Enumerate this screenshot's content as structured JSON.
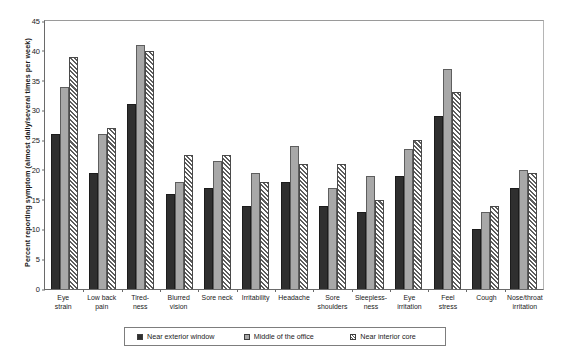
{
  "chart_data": {
    "type": "bar",
    "title": "",
    "xlabel": "",
    "ylabel": "Percent reporting symptom (almost daily/several times per week)",
    "ylim": [
      0,
      45
    ],
    "yticks": [
      0,
      5,
      10,
      15,
      20,
      25,
      30,
      35,
      40,
      45
    ],
    "grid": false,
    "legend_position": "bottom",
    "categories": [
      "Eye\nstrain",
      "Low back\npain",
      "Tired-\nness",
      "Blurred\nvision",
      "Sore neck",
      "Irritability",
      "Headache",
      "Sore\nshoulders",
      "Sleepless-\nness",
      "Eye\nirritation",
      "Feel\nstress",
      "Cough",
      "Nose/throat\nirritation"
    ],
    "series": [
      {
        "name": "Near exterior window",
        "color": "#2f2f2f",
        "pattern": "solid-dark",
        "values": [
          26,
          19.5,
          31,
          16,
          17,
          14,
          18,
          14,
          13,
          19,
          29,
          10,
          17
        ]
      },
      {
        "name": "Middle of the office",
        "color": "#a8a8a8",
        "pattern": "solid-gray",
        "values": [
          34,
          26,
          41,
          18,
          21.5,
          19.5,
          24,
          17,
          19,
          23.5,
          37,
          13,
          20
        ]
      },
      {
        "name": "Near interior core",
        "color": "#ffffff",
        "pattern": "diagonal-hatch",
        "values": [
          39,
          27,
          40,
          22.5,
          22.5,
          18,
          21,
          21,
          15,
          25,
          33,
          14,
          19.5
        ]
      }
    ]
  }
}
